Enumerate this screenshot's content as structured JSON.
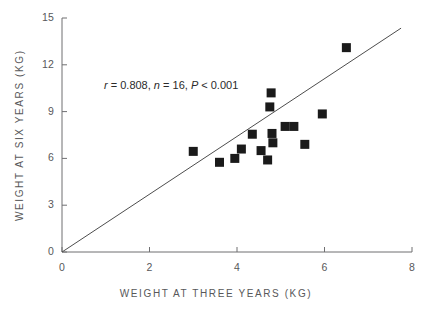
{
  "chart_data": {
    "type": "scatter",
    "title": "",
    "xlabel": "WEIGHT AT THREE YEARS (KG)",
    "ylabel": "WEIGHT AT SIX YEARS (KG)",
    "xlim": [
      0,
      8
    ],
    "ylim": [
      0,
      15
    ],
    "xticks": [
      0,
      2,
      4,
      6,
      8
    ],
    "yticks": [
      0,
      3,
      6,
      9,
      12,
      15
    ],
    "xticklabels": [
      "0",
      "2",
      "4",
      "6",
      "8"
    ],
    "yticklabels": [
      "0",
      "3",
      "6",
      "9",
      "12",
      "15"
    ],
    "grid": false,
    "legend": null,
    "marker": "square",
    "marker_color": "#1a1a1a",
    "annotation": {
      "text": "r = 0.808, n = 16, P < 0.001",
      "r": "0.808",
      "n": "16",
      "p": "P < 0.001",
      "x": 1.0,
      "y": 10.4
    },
    "fit_line": {
      "label": "line of equality",
      "x": [
        0.0,
        7.75
      ],
      "y": [
        0.0,
        14.35
      ],
      "color": "#4d4d4d"
    },
    "points": [
      {
        "x": 3.0,
        "y": 6.45
      },
      {
        "x": 3.6,
        "y": 5.75
      },
      {
        "x": 3.95,
        "y": 6.0
      },
      {
        "x": 4.1,
        "y": 6.6
      },
      {
        "x": 4.35,
        "y": 7.55
      },
      {
        "x": 4.55,
        "y": 6.5
      },
      {
        "x": 4.7,
        "y": 5.9
      },
      {
        "x": 4.75,
        "y": 9.3
      },
      {
        "x": 4.78,
        "y": 10.2
      },
      {
        "x": 4.8,
        "y": 7.6
      },
      {
        "x": 4.82,
        "y": 7.0
      },
      {
        "x": 5.1,
        "y": 8.05
      },
      {
        "x": 5.3,
        "y": 8.05
      },
      {
        "x": 5.55,
        "y": 6.9
      },
      {
        "x": 5.95,
        "y": 8.85
      },
      {
        "x": 6.5,
        "y": 13.1
      }
    ]
  }
}
